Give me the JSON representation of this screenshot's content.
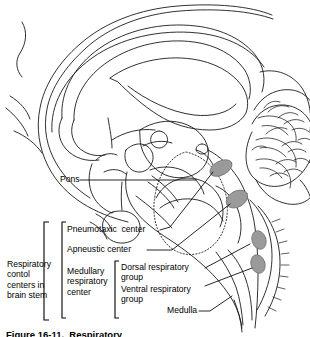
{
  "figure": {
    "kind": "anatomical-line-drawing",
    "title_caption": "Figure 16-11.  Respiratory",
    "background_color": "#ffffff",
    "line_color": "#000000",
    "shaded_region_color": "#9a9a9a"
  },
  "labels": {
    "pons": "Pons",
    "pneumotaxic_center": "Pneumotaxic  center",
    "apneustic_center": "Apneustic center",
    "medullary_respiratory_center": "Medullary\nrespiratory\ncenter",
    "respiratory_control_centers": "Respiratory\ncontol\ncenters in\nbrain stem",
    "dorsal_respiratory_group": "Dorsal respiratory\ngroup",
    "ventral_respiratory_group": "Ventral respiratory\ngroup",
    "medulla": "Medulla"
  },
  "anatomy": {
    "structures": [
      "cerebral cortex outline",
      "corpus callosum",
      "lateral ventricle",
      "thalamus",
      "midbrain",
      "pituitary gland",
      "pons",
      "medulla oblongata",
      "cerebellum",
      "spinal cord",
      "fourth ventricle"
    ],
    "shaded_ovals": [
      {
        "name": "pneumotaxic-center-oval",
        "cx": 221,
        "cy": 168,
        "rx": 12,
        "ry": 7,
        "rotate": -28
      },
      {
        "name": "apneustic-center-oval",
        "cx": 237,
        "cy": 199,
        "rx": 11,
        "ry": 8,
        "rotate": -30
      },
      {
        "name": "dorsal-respiratory-group-oval",
        "cx": 259,
        "cy": 240,
        "rx": 7,
        "ry": 9,
        "rotate": -18
      },
      {
        "name": "ventral-respiratory-group-oval",
        "cx": 258,
        "cy": 263,
        "rx": 7,
        "ry": 9,
        "rotate": -18
      }
    ]
  }
}
